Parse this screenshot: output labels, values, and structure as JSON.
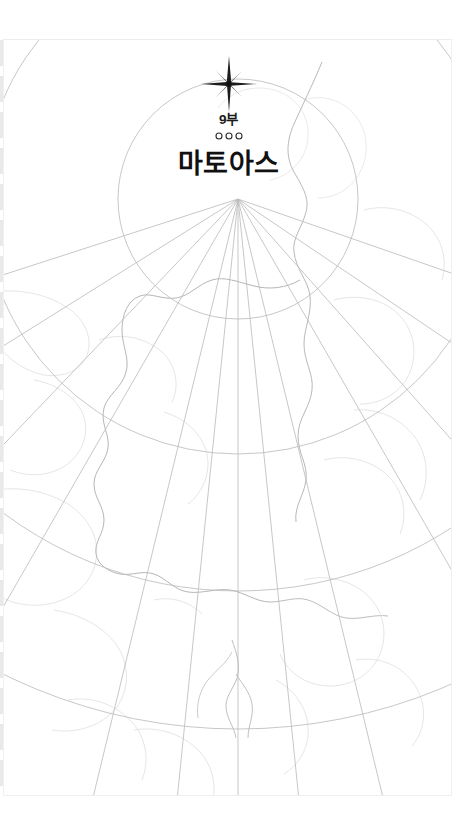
{
  "reader": {
    "page_background": "#ffffff",
    "sheet_border_color": "#f0f0f0"
  },
  "page": {
    "part_number": "9부",
    "title": "마토아스",
    "star_ornament": "four-pointed-star-icon",
    "divider_ornament": "three-circles-divider-icon",
    "divider_glyph_count": 3
  },
  "map": {
    "description": "conic-projection graticule watermark with faint coastlines",
    "graticule_color": "#b9b9b9",
    "coastline_color": "#dedede",
    "coastline_strong_color": "#b5b5b5",
    "pole_x": 234,
    "pole_y": 159,
    "meridian_count": 11,
    "parallel_count": 5,
    "parallel_radii": [
      120,
      255,
      392,
      530,
      668
    ],
    "meridian_angles_deg": [
      -72,
      -58,
      -44,
      -30,
      -16,
      0,
      16,
      30,
      44,
      58,
      72
    ]
  }
}
